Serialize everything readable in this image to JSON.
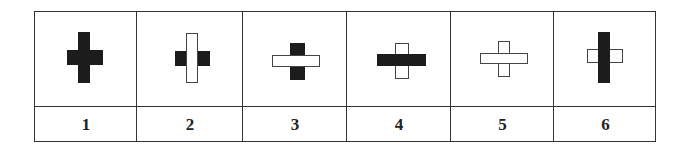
{
  "table": {
    "origin": {
      "x": 34,
      "y": 11
    },
    "column_edges": [
      34,
      136,
      242,
      346,
      450,
      553,
      656
    ],
    "divider_y": 105,
    "bottom_y": 142,
    "line_color": "#333333"
  },
  "cells": [
    {
      "label": "1",
      "shapes": [
        {
          "orientation": "vertical",
          "fill": "black",
          "x": 78,
          "y": 32,
          "w": 12,
          "h": 51,
          "z": 1
        },
        {
          "orientation": "horizontal",
          "fill": "black",
          "x": 67,
          "y": 50,
          "w": 36,
          "h": 15,
          "z": 2
        }
      ]
    },
    {
      "label": "2",
      "shapes": [
        {
          "orientation": "horizontal",
          "fill": "black",
          "x": 175,
          "y": 51,
          "w": 35,
          "h": 15,
          "z": 1
        },
        {
          "orientation": "vertical",
          "fill": "white",
          "x": 186,
          "y": 33,
          "w": 12,
          "h": 50,
          "z": 2
        }
      ]
    },
    {
      "label": "3",
      "shapes": [
        {
          "orientation": "vertical",
          "fill": "black",
          "x": 290,
          "y": 43,
          "w": 15,
          "h": 37,
          "z": 1
        },
        {
          "orientation": "horizontal",
          "fill": "white",
          "x": 272,
          "y": 55,
          "w": 48,
          "h": 12,
          "z": 2
        }
      ]
    },
    {
      "label": "4",
      "shapes": [
        {
          "orientation": "vertical",
          "fill": "white",
          "x": 395,
          "y": 43,
          "w": 14,
          "h": 36,
          "z": 1
        },
        {
          "orientation": "horizontal",
          "fill": "black",
          "x": 377,
          "y": 54,
          "w": 49,
          "h": 12,
          "z": 2
        }
      ]
    },
    {
      "label": "5",
      "shapes": [
        {
          "orientation": "vertical",
          "fill": "white",
          "x": 498,
          "y": 41,
          "w": 12,
          "h": 36,
          "z": 1
        },
        {
          "orientation": "horizontal",
          "fill": "white",
          "x": 480,
          "y": 53,
          "w": 48,
          "h": 11,
          "z": 2
        }
      ]
    },
    {
      "label": "6",
      "shapes": [
        {
          "orientation": "horizontal",
          "fill": "white",
          "x": 587,
          "y": 49,
          "w": 36,
          "h": 14,
          "z": 1
        },
        {
          "orientation": "vertical",
          "fill": "black",
          "x": 598,
          "y": 32,
          "w": 12,
          "h": 51,
          "z": 2
        }
      ]
    }
  ],
  "colors": {
    "black_fill": "#1c1c1c",
    "white_fill": "#ffffff",
    "outline": "#444444"
  }
}
